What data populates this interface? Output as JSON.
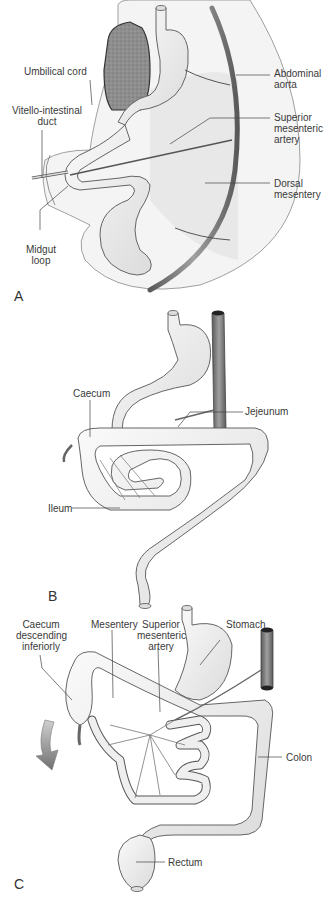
{
  "figure": {
    "panels": [
      {
        "id": "A",
        "letter": "A",
        "labels": {
          "umbilical_cord": "Umbilical cord",
          "vitello_1": "Vitello-intestinal",
          "vitello_2": "duct",
          "midgut_1": "Midgut",
          "midgut_2": "loop",
          "aorta_1": "Abdominal",
          "aorta_2": "aorta",
          "sma_1": "Superior",
          "sma_2": "mesenteric",
          "sma_3": "artery",
          "dorsal_1": "Dorsal",
          "dorsal_2": "mesentery"
        }
      },
      {
        "id": "B",
        "letter": "B",
        "labels": {
          "caecum": "Caecum",
          "jejeunum": "Jejeunum",
          "ileum": "Ileum"
        }
      },
      {
        "id": "C",
        "letter": "C",
        "labels": {
          "caecum_1": "Caecum",
          "caecum_2": "descending",
          "caecum_3": "inferiorly",
          "mesentery": "Mesentery",
          "sma_1": "Superior",
          "sma_2": "mesenteric",
          "sma_3": "artery",
          "stomach": "Stomach",
          "colon": "Colon",
          "rectum": "Rectum"
        }
      }
    ],
    "colors": {
      "gut_fill": "#eeeeee",
      "outline": "#555555",
      "liver": "#8c8c8c",
      "aorta": "#7a7a7a",
      "arrow": "#8a8a8a"
    }
  }
}
